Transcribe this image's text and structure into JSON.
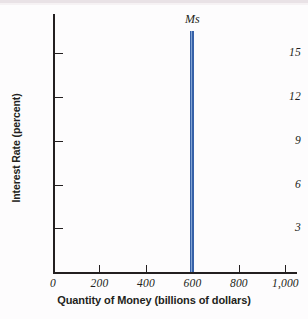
{
  "chart_data": {
    "type": "line",
    "title": "",
    "subtitle": "",
    "xlabel": "Quantity of Money (billions of dollars)",
    "ylabel": "Interest Rate (percent)",
    "xlim": [
      0,
      1050
    ],
    "ylim": [
      0,
      17.7
    ],
    "grid": false,
    "legend_position": "none",
    "x_ticks": [
      {
        "value": 0,
        "label": "0"
      },
      {
        "value": 200,
        "label": "200"
      },
      {
        "value": 400,
        "label": "400"
      },
      {
        "value": 600,
        "label": "600"
      },
      {
        "value": 800,
        "label": "800"
      },
      {
        "value": 1000,
        "label": "1,000"
      }
    ],
    "y_ticks": [
      {
        "value": 3,
        "label": "3"
      },
      {
        "value": 6,
        "label": "6"
      },
      {
        "value": 9,
        "label": "9"
      },
      {
        "value": 12,
        "label": "12"
      },
      {
        "value": 15,
        "label": "15"
      }
    ],
    "series": [
      {
        "name": "Ms",
        "annotation": "Ms",
        "description": "Perfectly inelastic money supply: vertical line at quantity of money = 600 billion dollars",
        "color": "#3761a8",
        "line_width_px": 4,
        "x": [
          600,
          600
        ],
        "values": [
          0,
          16.5
        ]
      }
    ],
    "colors": {
      "curve": "#3761a8",
      "curve_highlight": "#8fb0dc",
      "axis": "#231f20",
      "text": "#231f20",
      "background": "#fdfcfd"
    }
  }
}
